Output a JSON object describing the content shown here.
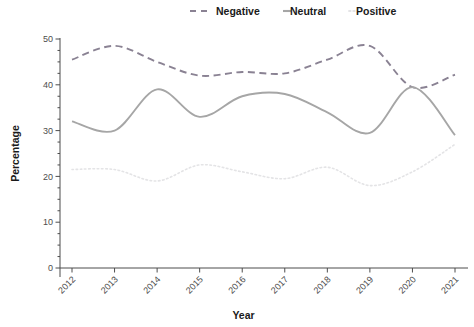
{
  "chart_data": {
    "type": "line",
    "title": "",
    "xlabel": "Year",
    "ylabel": "Percentage",
    "x": [
      2012,
      2013,
      2014,
      2015,
      2016,
      2017,
      2018,
      2019,
      2020,
      2021
    ],
    "categories": [
      "2012",
      "2013",
      "2014",
      "2015",
      "2016",
      "2017",
      "2018",
      "2019",
      "2020",
      "2021"
    ],
    "series": [
      {
        "name": "Negative",
        "style": "dashed",
        "color": "#8a8293",
        "values": [
          45.5,
          48.5,
          45.0,
          42.0,
          42.8,
          42.5,
          45.5,
          48.5,
          39.5,
          42.2
        ]
      },
      {
        "name": "Neutral",
        "style": "solid",
        "color": "#a6a6a6",
        "values": [
          32.0,
          30.0,
          39.0,
          33.0,
          37.5,
          38.0,
          34.0,
          29.5,
          39.5,
          29.0
        ]
      },
      {
        "name": "Positive",
        "style": "dotted",
        "color": "#e4e4e6",
        "values": [
          21.5,
          21.5,
          19.0,
          22.5,
          21.0,
          19.5,
          22.0,
          18.0,
          21.0,
          27.0
        ]
      }
    ],
    "ylim": [
      0,
      50
    ],
    "yticks": [
      0,
      10,
      20,
      30,
      40,
      50
    ],
    "yticklabels": [
      "0",
      "10",
      "20",
      "30",
      "40",
      "50"
    ],
    "minor_tick_step": 2.5,
    "grid": false,
    "legend_position": "top",
    "xtick_rotation": 45
  },
  "legend": {
    "items": [
      {
        "label": "Negative"
      },
      {
        "label": "Neutral"
      },
      {
        "label": "Positive"
      }
    ]
  },
  "axes": {
    "y_title": "Percentage",
    "x_title": "Year"
  }
}
